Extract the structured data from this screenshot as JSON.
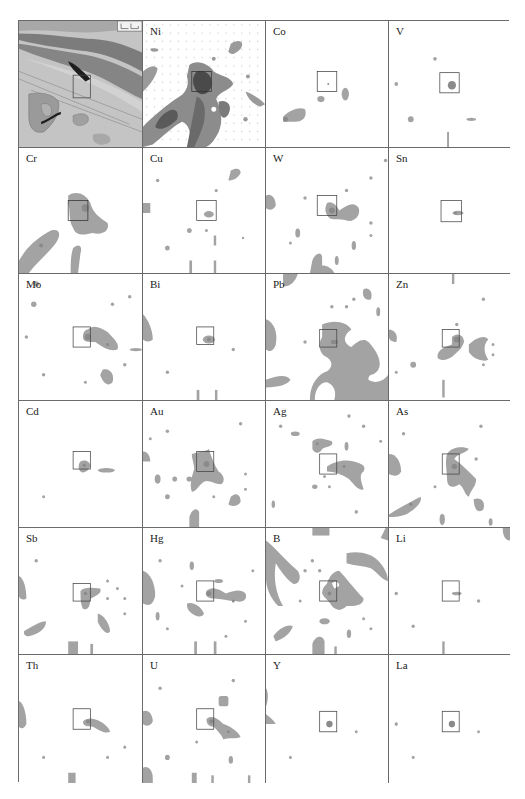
{
  "figure": {
    "rows": 6,
    "cols": 4,
    "study_area_box": {
      "x": 50,
      "y": 47,
      "w": 16,
      "h": 16
    },
    "colors": {
      "background": "#ffffff",
      "anomaly_fill": "#a3a3a3",
      "anomaly_core": "#7e7e7e",
      "grid_line": "#6a6a6a",
      "geo_light": "#c8c8c8",
      "geo_mid": "#9e9e9e",
      "geo_dark": "#7a7a7a",
      "ore_body": "#1e1e1e"
    }
  },
  "panels": [
    {
      "id": "geology",
      "label": "",
      "type": "geologic-map"
    },
    {
      "id": "Ni",
      "label": "Ni",
      "type": "anomaly-map",
      "intensity": "high"
    },
    {
      "id": "Co",
      "label": "Co",
      "type": "anomaly-map"
    },
    {
      "id": "V",
      "label": "V",
      "type": "anomaly-map"
    },
    {
      "id": "Cr",
      "label": "Cr",
      "type": "anomaly-map"
    },
    {
      "id": "Cu",
      "label": "Cu",
      "type": "anomaly-map"
    },
    {
      "id": "W",
      "label": "W",
      "type": "anomaly-map"
    },
    {
      "id": "Sn",
      "label": "Sn",
      "type": "anomaly-map"
    },
    {
      "id": "Mo",
      "label": "Mo",
      "type": "anomaly-map"
    },
    {
      "id": "Bi",
      "label": "Bi",
      "type": "anomaly-map"
    },
    {
      "id": "Pb",
      "label": "Pb",
      "type": "anomaly-map"
    },
    {
      "id": "Zn",
      "label": "Zn",
      "type": "anomaly-map"
    },
    {
      "id": "Cd",
      "label": "Cd",
      "type": "anomaly-map"
    },
    {
      "id": "Au",
      "label": "Au",
      "type": "anomaly-map"
    },
    {
      "id": "Ag",
      "label": "Ag",
      "type": "anomaly-map"
    },
    {
      "id": "As",
      "label": "As",
      "type": "anomaly-map"
    },
    {
      "id": "Sb",
      "label": "Sb",
      "type": "anomaly-map"
    },
    {
      "id": "Hg",
      "label": "Hg",
      "type": "anomaly-map"
    },
    {
      "id": "B",
      "label": "B",
      "type": "anomaly-map"
    },
    {
      "id": "Li",
      "label": "Li",
      "type": "anomaly-map"
    },
    {
      "id": "Th",
      "label": "Th",
      "type": "anomaly-map"
    },
    {
      "id": "U",
      "label": "U",
      "type": "anomaly-map"
    },
    {
      "id": "Y",
      "label": "Y",
      "type": "anomaly-map"
    },
    {
      "id": "La",
      "label": "La",
      "type": "anomaly-map"
    }
  ]
}
